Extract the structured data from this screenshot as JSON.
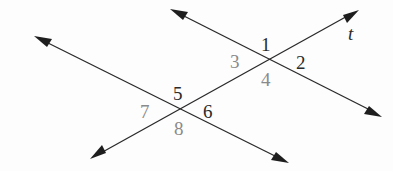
{
  "figure": {
    "transversal_label": "t",
    "angles": [
      {
        "label": "1",
        "tone": "dark"
      },
      {
        "label": "2",
        "tone": "dark"
      },
      {
        "label": "3",
        "tone": "gray"
      },
      {
        "label": "4",
        "tone": "gray"
      },
      {
        "label": "5",
        "tone": "dark"
      },
      {
        "label": "6",
        "tone": "dark"
      },
      {
        "label": "7",
        "tone": "gray"
      },
      {
        "label": "8",
        "tone": "gray"
      }
    ],
    "colors": {
      "line": "#2a2a2a",
      "label_dark": "#2a2a2a",
      "label_gray": "#8a8a8a",
      "background": "#fdfdfd"
    }
  }
}
